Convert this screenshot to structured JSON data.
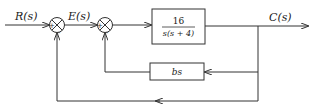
{
  "diagram": {
    "type": "block-diagram",
    "signals": {
      "input": "R(s)",
      "error": "E(s)",
      "output": "C(s)"
    },
    "blocks": {
      "forward": {
        "numerator": "16",
        "denominator": "s(s + 4)"
      },
      "feedback": {
        "label": "bs"
      }
    },
    "summing_junctions": {
      "first": {
        "plus": "+",
        "minus": "−"
      },
      "second": {
        "plus": "+",
        "minus": "−"
      }
    },
    "colors": {
      "line": "#333333",
      "background": "#ffffff"
    }
  }
}
